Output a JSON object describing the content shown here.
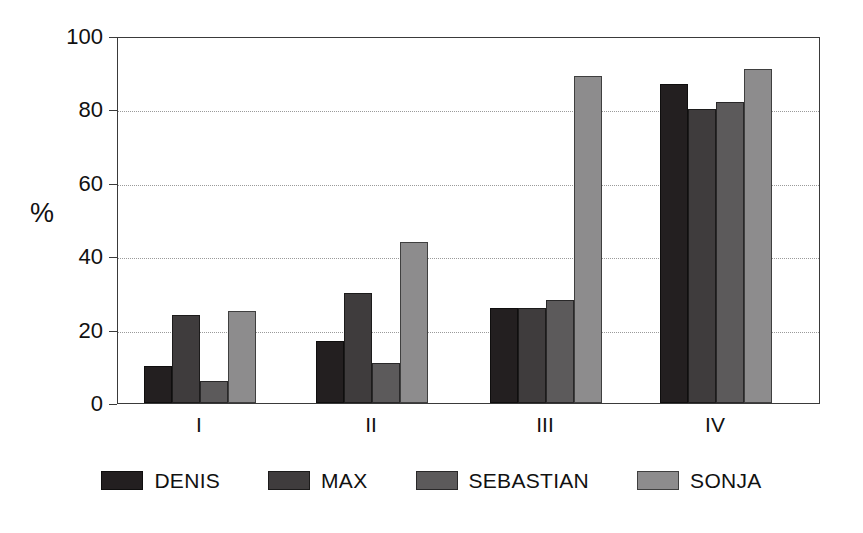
{
  "chart_data": {
    "type": "bar",
    "title": "",
    "subtitle": "",
    "xlabel": "",
    "ylabel": "%",
    "categories": [
      "I",
      "II",
      "III",
      "IV"
    ],
    "ylim": [
      0,
      100
    ],
    "yticks": [
      0,
      20,
      40,
      60,
      80,
      100
    ],
    "grid": true,
    "grid_style": "dotted-horizontal",
    "legend_position": "bottom-center",
    "series": [
      {
        "name": "DENIS",
        "color": "#231f20",
        "values": [
          10,
          17,
          26,
          87
        ]
      },
      {
        "name": "MAX",
        "color": "#3f3c3d",
        "values": [
          24,
          30,
          26,
          80
        ]
      },
      {
        "name": "SEBASTIAN",
        "color": "#5c5a5b",
        "values": [
          6,
          11,
          28,
          82
        ]
      },
      {
        "name": "SONJA",
        "color": "#8d8c8d",
        "values": [
          25,
          44,
          89,
          91
        ]
      }
    ]
  },
  "axis": {
    "y_title": "%",
    "tick_labels": [
      "100",
      "80",
      "60",
      "40",
      "20",
      "0"
    ],
    "x_tick_labels": [
      "I",
      "II",
      "III",
      "IV"
    ]
  },
  "legend": {
    "items": [
      {
        "label": "DENIS"
      },
      {
        "label": "MAX"
      },
      {
        "label": "SEBASTIAN"
      },
      {
        "label": "SONJA"
      }
    ]
  },
  "colors": {
    "axis": "#3a3a3a",
    "grid": "#9a9a9a",
    "text": "#111111",
    "background": "#ffffff"
  }
}
